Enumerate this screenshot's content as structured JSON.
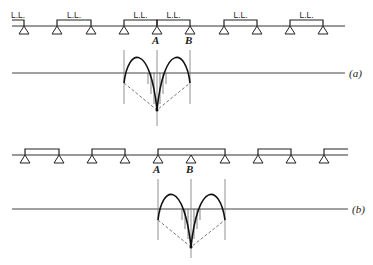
{
  "diagram_a": {
    "caption": "(a)",
    "load_label": "L.L.",
    "point_a": "A",
    "point_b": "B",
    "beam": {
      "y": 26,
      "x1": 12,
      "x2": 345
    },
    "supports_x": [
      24,
      57,
      91,
      124,
      157,
      190,
      224,
      257,
      290,
      323
    ],
    "loaded_spans": [
      [
        12,
        24
      ],
      [
        57,
        91
      ],
      [
        124,
        157
      ],
      [
        157,
        190
      ],
      [
        224,
        257
      ],
      [
        290,
        323
      ]
    ],
    "influence": {
      "baseline_y": 73,
      "left_x": 124,
      "a_x": 157,
      "right_x": 190
    }
  },
  "diagram_b": {
    "caption": "(b)",
    "point_a": "A",
    "point_b": "B",
    "beam": {
      "y": 155,
      "x1": 12,
      "x2": 348
    },
    "supports_x": [
      25,
      59,
      92,
      125,
      158,
      191,
      225,
      258,
      291,
      324
    ],
    "loaded_spans": [
      [
        25,
        59
      ],
      [
        92,
        125
      ],
      [
        158,
        225
      ],
      [
        258,
        291
      ],
      [
        324,
        348
      ]
    ],
    "influence": {
      "baseline_y": 209,
      "left_x": 158,
      "b_x": 191,
      "right_x": 225
    }
  }
}
